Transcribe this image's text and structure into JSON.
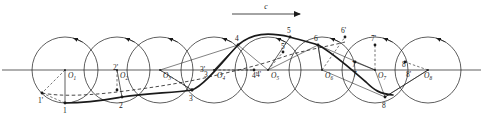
{
  "figure": {
    "background_color": "#ffffff",
    "stroke_color": "#1a1a1a",
    "width": 483,
    "height": 124
  },
  "velocity_arrow": {
    "label": "c",
    "x1": 232,
    "x2": 300,
    "y": 14,
    "label_x": 266,
    "label_y": 9
  },
  "baseline": {
    "name": "rolling-line",
    "x1": 2,
    "x2": 481,
    "y": 70
  },
  "geometry": {
    "radius": 33,
    "center_y": 70,
    "center_spacing": 52,
    "first_center_x": 65
  },
  "centers": [
    {
      "label": "O",
      "sub": "1",
      "cx": 65,
      "cy": 70,
      "label_x": 68,
      "label_y": 78
    },
    {
      "label": "O",
      "sub": "2",
      "cx": 117,
      "cy": 70,
      "label_x": 120,
      "label_y": 78
    },
    {
      "label": "O",
      "sub": "3",
      "cx": 160,
      "cy": 70,
      "label_x": 163,
      "label_y": 78
    },
    {
      "label": "O",
      "sub": "4",
      "cx": 214,
      "cy": 70,
      "label_x": 217,
      "label_y": 78
    },
    {
      "label": "O",
      "sub": "5",
      "cx": 268,
      "cy": 70,
      "label_x": 271,
      "label_y": 78
    },
    {
      "label": "O",
      "sub": "6",
      "cx": 322,
      "cy": 70,
      "label_x": 325,
      "label_y": 78
    },
    {
      "label": "O",
      "sub": "7",
      "cx": 375,
      "cy": 70,
      "label_x": 378,
      "label_y": 78
    },
    {
      "label": "O",
      "sub": "8",
      "cx": 428,
      "cy": 70,
      "label_x": 424,
      "label_y": 78
    }
  ],
  "trace_points": [
    {
      "label": "1",
      "x": 65,
      "y": 103,
      "label_x": 63,
      "label_y": 113
    },
    {
      "label": "2",
      "x": 122,
      "y": 97,
      "label_x": 119,
      "label_y": 108
    },
    {
      "label": "3",
      "x": 192,
      "y": 90,
      "label_x": 189,
      "label_y": 101
    },
    {
      "label": "4",
      "x": 238,
      "y": 45,
      "label_x": 235,
      "label_y": 41
    },
    {
      "label": "5",
      "x": 290,
      "y": 37,
      "label_x": 287,
      "label_y": 33
    },
    {
      "label": "6",
      "x": 318,
      "y": 45,
      "label_x": 314,
      "label_y": 41
    },
    {
      "label": "7",
      "x": 355,
      "y": 62,
      "label_x": 352,
      "label_y": 67
    },
    {
      "label": "8",
      "x": 385,
      "y": 97,
      "label_x": 382,
      "label_y": 108
    }
  ],
  "aux_points": [
    {
      "label": "1'",
      "x": 42,
      "y": 93,
      "label_x": 38,
      "label_y": 103
    },
    {
      "label": "2'",
      "x": 117,
      "y": 90,
      "label_x": 113,
      "label_y": 70
    },
    {
      "label": "3'",
      "x": 192,
      "y": 90,
      "label_x": 200,
      "label_y": 72
    },
    {
      "label": "4'",
      "x": 254,
      "y": 70,
      "label_x": 252,
      "label_y": 78
    },
    {
      "label": "5'",
      "x": 283,
      "y": 52,
      "label_x": 281,
      "label_y": 49
    },
    {
      "label": "6'",
      "x": 345,
      "y": 37,
      "label_x": 341,
      "label_y": 33
    },
    {
      "label": "7'",
      "x": 375,
      "y": 45,
      "label_x": 371,
      "label_y": 41
    },
    {
      "label": "8'",
      "x": 405,
      "y": 62,
      "label_x": 402,
      "label_y": 67
    }
  ],
  "axis_marks": [
    {
      "label": "3",
      "x": 204,
      "y": 77
    },
    {
      "label": "4'",
      "x": 256,
      "y": 77
    },
    {
      "label": "7",
      "x": 353,
      "y": 77
    },
    {
      "label": "8'",
      "x": 406,
      "y": 77
    }
  ],
  "curves": {
    "trochoid_solid": "M 65,103 C 90,103 105,100 122,97 C 150,93 172,93 192,90 C 205,85 222,62 238,45 C 252,33 268,32 290,37 C 300,40 310,42 318,45 C 332,52 352,70 366,82 C 374,90 380,94 393,95",
    "trochoid_dashed": "M 42,93 C 62,97 92,95 117,92 C 150,88 175,84 200,79 C 230,72 258,66 283,57 C 300,51 330,46 345,42"
  }
}
